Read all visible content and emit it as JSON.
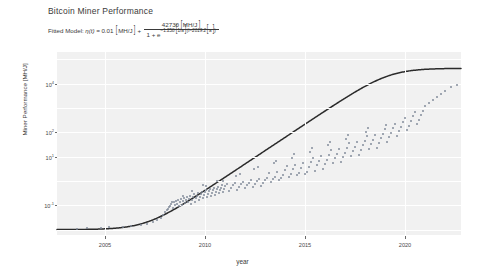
{
  "figure": {
    "title": "Bitcoin Miner Performance",
    "formula": {
      "prefix": "Fitted Model:",
      "lhs": "η(t) =",
      "baseline_value": "0.01",
      "baseline_unit": "MH/J",
      "plus": "+",
      "numerator_value": "42730",
      "numerator_unit": "MH/J",
      "denominator_one": "1 + e",
      "rate": "−1.258",
      "rate_unit": "1/a",
      "t_term": "(t−2019.2",
      "t_unit": "a",
      "close": ")"
    }
  },
  "chart_data": {
    "type": "scatter",
    "title": "Bitcoin Miner Performance",
    "xlabel": "year",
    "ylabel": "Miner Performance [MH/J]",
    "yscale": "log",
    "xlim": [
      2002.6,
      2022.8
    ],
    "ylim": [
      0.006,
      200000
    ],
    "xticks": [
      2005,
      2010,
      2015,
      2020
    ],
    "yticks": [
      {
        "label": "10",
        "exp": "4",
        "value": 10000
      },
      {
        "label": "10",
        "exp": "2",
        "value": 100
      },
      {
        "label": "10",
        "exp": "1",
        "value": 10
      },
      {
        "label": "10",
        "exp": "-1",
        "value": 0.1
      }
    ],
    "grid": true,
    "legend": "none",
    "fit": {
      "name": "Fitted logistic model",
      "color": "#2b2b2b",
      "baseline": 0.01,
      "amplitude": 42730,
      "rate": -1.258,
      "midpoint": 2019.2
    },
    "points_color": "#7d8797",
    "points": [
      [
        2003.6,
        0.0105
      ],
      [
        2004.1,
        0.0112
      ],
      [
        2004.8,
        0.0118
      ],
      [
        2005.2,
        0.0125
      ],
      [
        2005.9,
        0.0131
      ],
      [
        2006.3,
        0.0142
      ],
      [
        2006.8,
        0.0155
      ],
      [
        2007.1,
        0.0168
      ],
      [
        2007.4,
        0.0205
      ],
      [
        2007.6,
        0.0255
      ],
      [
        2007.8,
        0.031
      ],
      [
        2007.9,
        0.0385
      ],
      [
        2008.0,
        0.051
      ],
      [
        2008.1,
        0.062
      ],
      [
        2008.15,
        0.0735
      ],
      [
        2008.2,
        0.088
      ],
      [
        2008.25,
        0.096
      ],
      [
        2008.3,
        0.112
      ],
      [
        2008.35,
        0.131
      ],
      [
        2008.4,
        0.081
      ],
      [
        2008.45,
        0.142
      ],
      [
        2008.5,
        0.099
      ],
      [
        2008.55,
        0.151
      ],
      [
        2008.6,
        0.118
      ],
      [
        2008.65,
        0.165
      ],
      [
        2008.7,
        0.093
      ],
      [
        2008.75,
        0.137
      ],
      [
        2008.8,
        0.181
      ],
      [
        2008.85,
        0.106
      ],
      [
        2008.9,
        0.146
      ],
      [
        2008.95,
        0.195
      ],
      [
        2009.0,
        0.122
      ],
      [
        2009.05,
        0.168
      ],
      [
        2009.1,
        0.213
      ],
      [
        2009.15,
        0.134
      ],
      [
        2009.2,
        0.188
      ],
      [
        2009.25,
        0.241
      ],
      [
        2009.3,
        0.115
      ],
      [
        2009.35,
        0.161
      ],
      [
        2009.4,
        0.221
      ],
      [
        2009.45,
        0.278
      ],
      [
        2009.5,
        0.142
      ],
      [
        2009.55,
        0.196
      ],
      [
        2009.6,
        0.252
      ],
      [
        2009.65,
        0.312
      ],
      [
        2009.7,
        0.168
      ],
      [
        2009.75,
        0.229
      ],
      [
        2009.8,
        0.295
      ],
      [
        2009.85,
        0.351
      ],
      [
        2009.9,
        0.193
      ],
      [
        2009.95,
        0.264
      ],
      [
        2010.0,
        0.338
      ],
      [
        2010.05,
        0.412
      ],
      [
        2010.1,
        0.218
      ],
      [
        2010.15,
        0.291
      ],
      [
        2010.2,
        0.382
      ],
      [
        2010.25,
        0.461
      ],
      [
        2010.3,
        0.244
      ],
      [
        2010.35,
        0.331
      ],
      [
        2010.4,
        0.418
      ],
      [
        2010.45,
        0.521
      ],
      [
        2010.5,
        0.276
      ],
      [
        2010.55,
        0.368
      ],
      [
        2010.6,
        0.472
      ],
      [
        2010.65,
        0.584
      ],
      [
        2010.7,
        0.312
      ],
      [
        2010.75,
        0.415
      ],
      [
        2010.8,
        0.532
      ],
      [
        2010.85,
        0.661
      ],
      [
        2010.9,
        0.351
      ],
      [
        2010.95,
        0.466
      ],
      [
        2011.0,
        0.598
      ],
      [
        2011.1,
        0.743
      ],
      [
        2011.2,
        0.395
      ],
      [
        2011.3,
        0.524
      ],
      [
        2011.4,
        0.672
      ],
      [
        2011.5,
        0.833
      ],
      [
        2011.6,
        0.442
      ],
      [
        2011.7,
        0.589
      ],
      [
        2011.8,
        0.753
      ],
      [
        2011.9,
        0.938
      ],
      [
        2012.0,
        0.498
      ],
      [
        2012.1,
        0.661
      ],
      [
        2012.2,
        0.847
      ],
      [
        2012.3,
        1.052
      ],
      [
        2012.4,
        0.561
      ],
      [
        2012.5,
        0.743
      ],
      [
        2012.6,
        0.951
      ],
      [
        2012.7,
        1.183
      ],
      [
        2012.8,
        0.628
      ],
      [
        2012.9,
        0.836
      ],
      [
        2013.0,
        1.07
      ],
      [
        2013.1,
        1.328
      ],
      [
        2013.2,
        2.14
      ],
      [
        2013.3,
        0.938
      ],
      [
        2013.4,
        1.201
      ],
      [
        2013.5,
        1.491
      ],
      [
        2013.6,
        2.41
      ],
      [
        2013.7,
        1.052
      ],
      [
        2013.8,
        1.351
      ],
      [
        2013.9,
        1.678
      ],
      [
        2014.0,
        2.71
      ],
      [
        2014.1,
        4.2
      ],
      [
        2014.2,
        1.521
      ],
      [
        2014.3,
        1.889
      ],
      [
        2014.4,
        3.05
      ],
      [
        2014.5,
        4.72
      ],
      [
        2014.6,
        1.71
      ],
      [
        2014.7,
        2.12
      ],
      [
        2014.8,
        3.43
      ],
      [
        2014.9,
        5.31
      ],
      [
        2015.0,
        1.92
      ],
      [
        2015.1,
        2.38
      ],
      [
        2015.2,
        3.86
      ],
      [
        2015.3,
        5.97
      ],
      [
        2015.4,
        9.2
      ],
      [
        2015.5,
        2.68
      ],
      [
        2015.6,
        4.34
      ],
      [
        2015.7,
        6.72
      ],
      [
        2015.8,
        10.3
      ],
      [
        2015.9,
        3.01
      ],
      [
        2016.0,
        4.88
      ],
      [
        2016.1,
        7.56
      ],
      [
        2016.2,
        11.6
      ],
      [
        2016.3,
        18.0
      ],
      [
        2016.4,
        5.49
      ],
      [
        2016.5,
        8.5
      ],
      [
        2016.6,
        13.05
      ],
      [
        2016.7,
        20.2
      ],
      [
        2016.8,
        6.17
      ],
      [
        2016.9,
        9.56
      ],
      [
        2017.0,
        14.68
      ],
      [
        2017.1,
        22.7
      ],
      [
        2017.2,
        35.0
      ],
      [
        2017.3,
        10.75
      ],
      [
        2017.4,
        16.51
      ],
      [
        2017.5,
        25.5
      ],
      [
        2017.6,
        39.4
      ],
      [
        2017.7,
        12.1
      ],
      [
        2017.8,
        18.57
      ],
      [
        2017.9,
        28.7
      ],
      [
        2018.0,
        44.3
      ],
      [
        2018.1,
        68.0
      ],
      [
        2018.2,
        20.9
      ],
      [
        2018.3,
        32.3
      ],
      [
        2018.4,
        49.8
      ],
      [
        2018.5,
        76.5
      ],
      [
        2018.6,
        23.5
      ],
      [
        2018.7,
        36.3
      ],
      [
        2018.8,
        56.0
      ],
      [
        2018.9,
        86.0
      ],
      [
        2019.0,
        132.0
      ],
      [
        2019.1,
        40.8
      ],
      [
        2019.2,
        63.0
      ],
      [
        2019.3,
        97.0
      ],
      [
        2019.4,
        149.0
      ],
      [
        2019.5,
        230.0
      ],
      [
        2019.6,
        71.0
      ],
      [
        2019.7,
        109.0
      ],
      [
        2019.8,
        168.0
      ],
      [
        2019.9,
        258.0
      ],
      [
        2020.0,
        398.0
      ],
      [
        2020.1,
        123.0
      ],
      [
        2020.2,
        189.0
      ],
      [
        2020.3,
        291.0
      ],
      [
        2020.4,
        448.0
      ],
      [
        2020.5,
        690.0
      ],
      [
        2020.6,
        213.0
      ],
      [
        2020.7,
        327.0
      ],
      [
        2020.8,
        504.0
      ],
      [
        2020.9,
        776.0
      ],
      [
        2021.0,
        1195.0
      ],
      [
        2021.2,
        1560.0
      ],
      [
        2021.4,
        2100.0
      ],
      [
        2021.6,
        2850.0
      ],
      [
        2021.8,
        3900.0
      ],
      [
        2022.0,
        5200.0
      ],
      [
        2022.3,
        7100.0
      ],
      [
        2022.6,
        9200.0
      ],
      [
        2012.45,
        3.2
      ],
      [
        2011.55,
        1.65
      ],
      [
        2010.62,
        1.04
      ],
      [
        2009.88,
        0.69
      ],
      [
        2013.45,
        5.6
      ],
      [
        2014.35,
        8.9
      ],
      [
        2015.25,
        15.5
      ],
      [
        2016.15,
        29.0
      ],
      [
        2017.05,
        52.0
      ],
      [
        2018.05,
        104.0
      ],
      [
        2019.05,
        196.0
      ],
      [
        2008.9,
        0.24
      ],
      [
        2009.35,
        0.39
      ],
      [
        2010.05,
        0.62
      ],
      [
        2010.9,
        0.99
      ],
      [
        2011.75,
        1.95
      ],
      [
        2012.65,
        3.6
      ],
      [
        2013.55,
        6.9
      ],
      [
        2014.45,
        12.5
      ],
      [
        2015.35,
        22.0
      ],
      [
        2016.25,
        41.0
      ],
      [
        2017.15,
        78.0
      ],
      [
        2018.15,
        150.0
      ]
    ]
  }
}
